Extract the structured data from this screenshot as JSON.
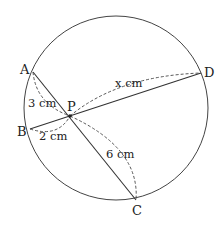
{
  "diagram": {
    "type": "intersecting-chords",
    "circle": {
      "cx": 116,
      "cy": 108,
      "r": 92
    },
    "points": {
      "A": {
        "label": "A",
        "x": 33,
        "y": 72
      },
      "B": {
        "label": "B",
        "x": 30,
        "y": 129
      },
      "C": {
        "label": "C",
        "x": 136,
        "y": 200
      },
      "D": {
        "label": "D",
        "x": 201,
        "y": 73
      },
      "P": {
        "label": "P",
        "x": 70,
        "y": 116
      }
    },
    "chords": [
      {
        "name": "AC",
        "from": "A",
        "to": "C"
      },
      {
        "name": "BD",
        "from": "B",
        "to": "D"
      }
    ],
    "measurements": {
      "AP": "3 cm",
      "BP": "2 cm",
      "PC": "6 cm",
      "PD": "x cm"
    },
    "colors": {
      "stroke": "#333333",
      "text": "#222222"
    }
  }
}
